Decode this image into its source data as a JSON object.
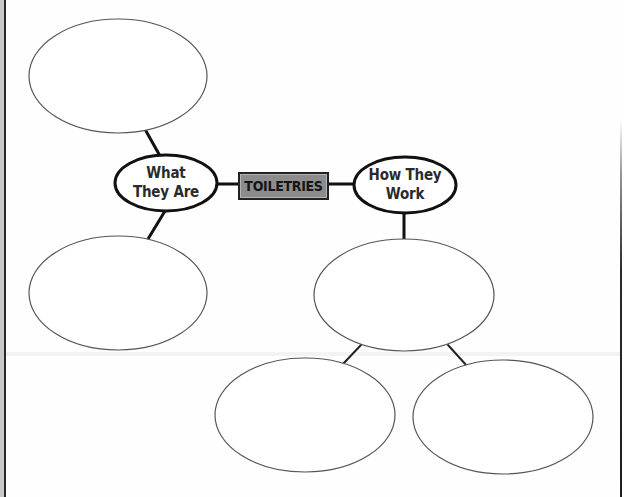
{
  "diagram": {
    "type": "concept-map",
    "center": {
      "label": "TOILETRIES",
      "fill": "#8c8c8c",
      "border": "#222222"
    },
    "branches": [
      {
        "id": "what-they-are",
        "line1": "What",
        "line2": "They Are",
        "children": [
          {
            "id": "blank-top-left",
            "text": ""
          },
          {
            "id": "blank-bottom-left",
            "text": ""
          }
        ]
      },
      {
        "id": "how-they-work",
        "line1": "How They",
        "line2": "Work",
        "children": [
          {
            "id": "blank-middle-right",
            "text": "",
            "children": [
              {
                "id": "blank-bottom-center",
                "text": ""
              },
              {
                "id": "blank-bottom-right",
                "text": ""
              }
            ]
          }
        ]
      }
    ],
    "colors": {
      "line": "#111111",
      "blank_ellipse_stroke": "#555555",
      "label_text": "#2b2b2b"
    }
  }
}
